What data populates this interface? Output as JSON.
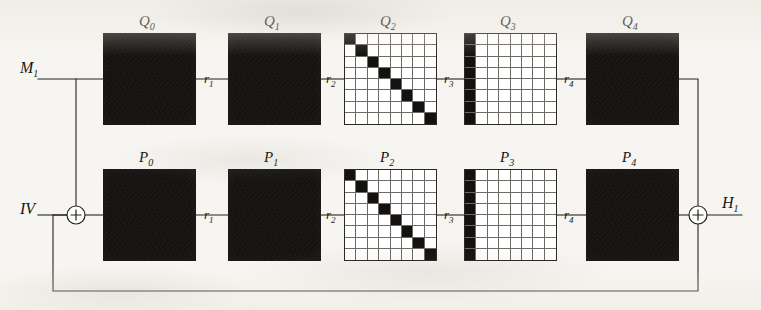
{
  "diagram": {
    "colors": {
      "ink": "#17150f",
      "block_fill": "#141210",
      "paper": "#f7f5f1",
      "grid_line": "#6d6a65"
    },
    "io_labels": {
      "message_input": "M",
      "message_input_sub": "1",
      "iv_input": "IV",
      "output": "H",
      "output_sub": "1"
    },
    "top_row": {
      "name": "Q-row",
      "blocks": [
        {
          "label": "Q",
          "sub": "0",
          "kind": "solid"
        },
        {
          "label": "Q",
          "sub": "1",
          "kind": "solid"
        },
        {
          "label": "Q",
          "sub": "2",
          "kind": "matrix-diagonal"
        },
        {
          "label": "Q",
          "sub": "3",
          "kind": "matrix-first-column"
        },
        {
          "label": "Q",
          "sub": "4",
          "kind": "solid"
        }
      ]
    },
    "bottom_row": {
      "name": "P-row",
      "blocks": [
        {
          "label": "P",
          "sub": "0",
          "kind": "solid"
        },
        {
          "label": "P",
          "sub": "1",
          "kind": "solid"
        },
        {
          "label": "P",
          "sub": "2",
          "kind": "matrix-diagonal"
        },
        {
          "label": "P",
          "sub": "3",
          "kind": "matrix-first-column"
        },
        {
          "label": "P",
          "sub": "4",
          "kind": "solid"
        }
      ]
    },
    "round_labels": [
      {
        "label": "r",
        "sub": "1"
      },
      {
        "label": "r",
        "sub": "2"
      },
      {
        "label": "r",
        "sub": "3"
      },
      {
        "label": "r",
        "sub": "4"
      }
    ],
    "xor_gates": [
      {
        "name": "input-xor",
        "glyph": "+"
      },
      {
        "name": "output-xor",
        "glyph": "+"
      }
    ],
    "matrix": {
      "grid_size": 8,
      "diagonal_description": "identity: black cells on main diagonal",
      "first_column_description": "black cells filling the leftmost column"
    }
  }
}
